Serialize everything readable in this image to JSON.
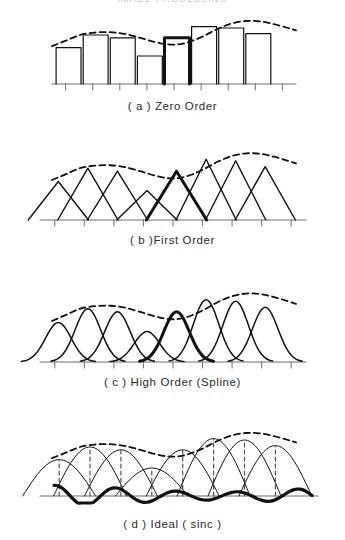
{
  "figure": {
    "title_strip": "IMAGE PROCESSING",
    "width": 345,
    "height": 540,
    "background": "#ffffff",
    "ink_color": "#111111",
    "axis_color": "#6f6f6f",
    "dash_color": "#111111"
  },
  "panels": [
    {
      "id": "zero-order",
      "caption": "( a ) Zero Order",
      "kind": "staircase",
      "top": 8,
      "plot_height": 88,
      "caption_top": 100,
      "axis": {
        "x0": 52,
        "x1": 296,
        "baseline_y": 76,
        "tick_len": 6,
        "n_cells": 9
      },
      "samples": [
        0.52,
        0.7,
        0.66,
        0.4,
        0.66,
        0.82,
        0.8,
        0.72
      ],
      "highlight_index": 4,
      "envelope": [
        [
          52,
          0.54
        ],
        [
          66,
          0.62
        ],
        [
          80,
          0.7
        ],
        [
          95,
          0.735
        ],
        [
          110,
          0.74
        ],
        [
          125,
          0.715
        ],
        [
          140,
          0.66
        ],
        [
          155,
          0.6
        ],
        [
          168,
          0.565
        ],
        [
          180,
          0.57
        ],
        [
          192,
          0.615
        ],
        [
          205,
          0.695
        ],
        [
          218,
          0.79
        ],
        [
          232,
          0.865
        ],
        [
          246,
          0.9
        ],
        [
          260,
          0.895
        ],
        [
          274,
          0.855
        ],
        [
          288,
          0.8
        ],
        [
          296,
          0.765
        ]
      ],
      "envelope_label": "dashed-original-signal"
    },
    {
      "id": "first-order",
      "caption": "( b )First Order",
      "kind": "triangles",
      "top": 140,
      "plot_height": 88,
      "caption_top": 234,
      "axis": {
        "x0": 40,
        "x1": 306,
        "baseline_y": 80,
        "tick_len": 6,
        "n_cells": 9
      },
      "samples": [
        0.52,
        0.7,
        0.66,
        0.4,
        0.66,
        0.82,
        0.8,
        0.72
      ],
      "highlight_index": 4,
      "envelope": [
        [
          52,
          0.54
        ],
        [
          66,
          0.62
        ],
        [
          80,
          0.7
        ],
        [
          95,
          0.735
        ],
        [
          110,
          0.74
        ],
        [
          125,
          0.715
        ],
        [
          140,
          0.66
        ],
        [
          155,
          0.6
        ],
        [
          168,
          0.565
        ],
        [
          180,
          0.57
        ],
        [
          192,
          0.615
        ],
        [
          205,
          0.695
        ],
        [
          218,
          0.79
        ],
        [
          232,
          0.865
        ],
        [
          246,
          0.9
        ],
        [
          260,
          0.895
        ],
        [
          274,
          0.855
        ],
        [
          288,
          0.8
        ],
        [
          296,
          0.765
        ]
      ]
    },
    {
      "id": "high-order-spline",
      "caption": "( c ) High Order (Spline)",
      "kind": "splines",
      "top": 280,
      "plot_height": 90,
      "caption_top": 376,
      "axis": {
        "x0": 40,
        "x1": 306,
        "baseline_y": 82,
        "tick_len": 6,
        "n_cells": 9
      },
      "samples": [
        0.52,
        0.7,
        0.66,
        0.4,
        0.66,
        0.82,
        0.8,
        0.72
      ],
      "highlight_index": 4,
      "envelope": [
        [
          52,
          0.54
        ],
        [
          66,
          0.62
        ],
        [
          80,
          0.7
        ],
        [
          95,
          0.735
        ],
        [
          110,
          0.74
        ],
        [
          125,
          0.715
        ],
        [
          140,
          0.66
        ],
        [
          155,
          0.6
        ],
        [
          168,
          0.565
        ],
        [
          180,
          0.57
        ],
        [
          192,
          0.615
        ],
        [
          205,
          0.695
        ],
        [
          218,
          0.79
        ],
        [
          232,
          0.865
        ],
        [
          246,
          0.9
        ],
        [
          260,
          0.895
        ],
        [
          274,
          0.855
        ],
        [
          288,
          0.8
        ],
        [
          296,
          0.765
        ]
      ]
    },
    {
      "id": "ideal-sinc",
      "caption": "( d ) Ideal ( sinc )",
      "kind": "sinc",
      "top": 420,
      "plot_height": 92,
      "caption_top": 518,
      "axis": {
        "x0": 40,
        "x1": 318,
        "baseline_y": 76,
        "tick_len": 0,
        "n_cells": 9
      },
      "samples": [
        0.52,
        0.7,
        0.66,
        0.4,
        0.66,
        0.82,
        0.8,
        0.72
      ],
      "highlight_index": 4,
      "envelope": [
        [
          52,
          0.54
        ],
        [
          66,
          0.62
        ],
        [
          80,
          0.7
        ],
        [
          95,
          0.735
        ],
        [
          110,
          0.74
        ],
        [
          125,
          0.715
        ],
        [
          140,
          0.66
        ],
        [
          155,
          0.6
        ],
        [
          168,
          0.565
        ],
        [
          180,
          0.57
        ],
        [
          192,
          0.615
        ],
        [
          205,
          0.695
        ],
        [
          218,
          0.79
        ],
        [
          232,
          0.865
        ],
        [
          246,
          0.9
        ],
        [
          260,
          0.895
        ],
        [
          274,
          0.855
        ],
        [
          288,
          0.8
        ],
        [
          296,
          0.765
        ]
      ],
      "stems": "dashed-vertical-sample-lines",
      "ripple": "bold-sinc-sum-with-sidelobes"
    }
  ],
  "chart_data": {
    "type": "line",
    "xlabel": "",
    "ylabel": "",
    "grid": false,
    "legend": "none",
    "series": [
      {
        "name": "Zero Order (nearest-neighbour hold)",
        "values": [
          0.52,
          0.7,
          0.66,
          0.4,
          0.66,
          0.82,
          0.8,
          0.72
        ]
      },
      {
        "name": "First Order (linear / triangle)",
        "values": [
          0.52,
          0.7,
          0.66,
          0.4,
          0.66,
          0.82,
          0.8,
          0.72
        ]
      },
      {
        "name": "High Order (Spline)",
        "values": [
          0.52,
          0.7,
          0.66,
          0.4,
          0.66,
          0.82,
          0.8,
          0.72
        ]
      },
      {
        "name": "Ideal (sinc)",
        "values": [
          0.52,
          0.7,
          0.66,
          0.4,
          0.66,
          0.82,
          0.8,
          0.72
        ]
      }
    ],
    "annotations": [
      "dashed curve = original continuous signal envelope",
      "bold kernel = one highlighted sample's contribution"
    ]
  }
}
